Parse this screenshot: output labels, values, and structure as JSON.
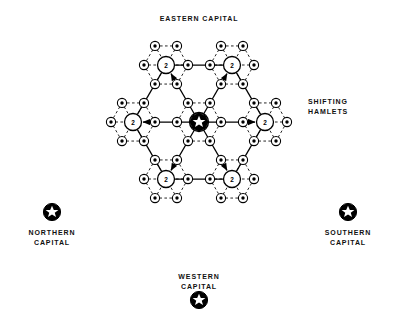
{
  "figure": {
    "title_labels": {
      "eastern": "EASTERN CAPITAL",
      "shifting": "SHIFTING\nHAMLETS",
      "northern": "NORTHERN\nCAPITAL",
      "southern": "SOUTHERN\nCAPITAL",
      "western": "WESTERN\nCAPITAL"
    },
    "icons": {
      "capital_star": "star-in-circle-icon",
      "market_center": "circle-node-icon",
      "hamlet": "small-circle-node-icon",
      "arrow": "arrow-icon"
    },
    "node_labels": {
      "center": "★",
      "level2": "2",
      "level3": "3"
    }
  },
  "chart_data": {
    "type": "diagram",
    "legend_position": "right",
    "geometry": {
      "center": {
        "x": 199,
        "y": 122
      },
      "ring2_radius": 66,
      "ring3_radius": 22,
      "level2_circle_r": 8.5,
      "level3_circle_r": 4.6,
      "center_circle_r": 9.5
    },
    "nodes": {
      "capital": {
        "label": "★",
        "rank": 1,
        "x": 199,
        "y": 122
      },
      "markets": [
        {
          "label": "2",
          "rank": 2,
          "x": 265,
          "y": 122,
          "angle": 0
        },
        {
          "label": "2",
          "rank": 2,
          "x": 232,
          "y": 65,
          "angle": 300
        },
        {
          "label": "2",
          "rank": 2,
          "x": 166,
          "y": 65,
          "angle": 240
        },
        {
          "label": "2",
          "rank": 2,
          "x": 133,
          "y": 122,
          "angle": 180
        },
        {
          "label": "2",
          "rank": 2,
          "x": 166,
          "y": 179,
          "angle": 120
        },
        {
          "label": "2",
          "rank": 2,
          "x": 232,
          "y": 179,
          "angle": 60
        }
      ],
      "hamlet_label": "3",
      "hamlet_ring_count": 6,
      "hamlet_ring_angles": [
        0,
        60,
        120,
        180,
        240,
        300
      ]
    },
    "edges": {
      "solid_description": "Solid lines with arrowheads from capital outward to each market center",
      "dashed_description": "Dashed lines forming hexagonal hamlet rings around every center",
      "arrow_count": 6
    },
    "corner_capitals": [
      {
        "name": "NORTHERN\nCAPITAL",
        "star_x": 52,
        "star_y": 212
      },
      {
        "name": "SOUTHERN\nCAPITAL",
        "star_x": 348,
        "star_y": 212
      },
      {
        "name": "WESTERN\nCAPITAL",
        "star_x": 199,
        "star_y": 300
      },
      {
        "name": "EASTERN CAPITAL",
        "star_x": 199,
        "star_y": 122
      }
    ]
  }
}
